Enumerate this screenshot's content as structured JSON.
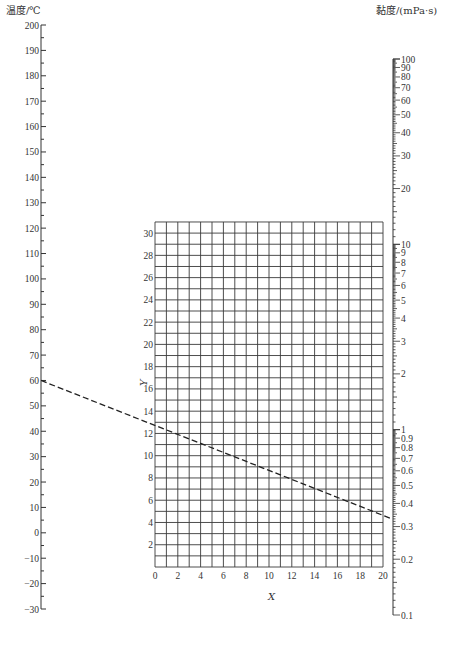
{
  "chart_data": {
    "type": "nomogram",
    "title": "",
    "left_axis": {
      "label": "温度/℃",
      "min": -30,
      "max": 200,
      "major_step": 10,
      "minor_step": 5,
      "tick_labels": [
        "200",
        "190",
        "180",
        "170",
        "160",
        "150",
        "140",
        "130",
        "120",
        "110",
        "100",
        "90",
        "80",
        "70",
        "60",
        "50",
        "40",
        "30",
        "20",
        "10",
        "0",
        "−10",
        "−20",
        "−30"
      ]
    },
    "right_axis": {
      "label": "黏度/(mPa·s)",
      "scale": "log",
      "min": 0.1,
      "max": 100,
      "tick_labels": [
        "100",
        "90",
        "80",
        "70",
        "60",
        "50",
        "40",
        "30",
        "20",
        "10",
        "9",
        "8",
        "7",
        "6",
        "5",
        "4",
        "3",
        "2",
        "1",
        "0.9",
        "0.8",
        "0.7",
        "0.6",
        "0.5",
        "0.4",
        "0.3",
        "0.2",
        "0.1"
      ]
    },
    "grid": {
      "xlabel": "X",
      "ylabel": "Y",
      "x_range": [
        0,
        20
      ],
      "y_range": [
        0,
        31
      ],
      "x_step": 1,
      "y_step": 1,
      "x_tick_labels": [
        "0",
        "2",
        "4",
        "6",
        "8",
        "10",
        "12",
        "14",
        "16",
        "18",
        "20"
      ],
      "y_tick_labels": [
        "2",
        "4",
        "6",
        "8",
        "10",
        "12",
        "14",
        "16",
        "18",
        "20",
        "22",
        "24",
        "26",
        "28",
        "30"
      ]
    },
    "annotation_line": {
      "style": "dashed",
      "from": {
        "axis": "temperature",
        "value": 60
      },
      "to": {
        "axis": "viscosity",
        "value": 0.33
      },
      "passes_through_grid_left_edge_y": 16.3,
      "passes_through_grid_right_edge_y": 5.5
    }
  },
  "labels": {
    "temp_axis_title": "温度/℃",
    "visc_axis_title": "黏度/(mPa·s)",
    "x_axis_title": "X",
    "y_axis_title": "Y"
  },
  "colors": {
    "axis": "#333333",
    "grid": "#3a3a3a",
    "dashed_line": "#222222"
  }
}
